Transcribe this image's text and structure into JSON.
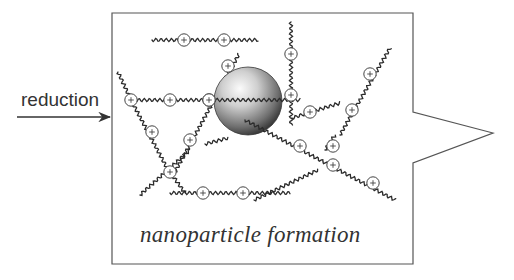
{
  "diagram": {
    "input_label": "reduction",
    "caption": "nanoparticle formation",
    "arrow": {
      "from": [
        17,
        117
      ],
      "to": [
        110,
        117
      ],
      "color": "#333333"
    },
    "box": {
      "outline": [
        [
          112,
          13
        ],
        [
          413,
          13
        ],
        [
          413,
          112
        ],
        [
          493,
          133
        ],
        [
          413,
          163
        ],
        [
          413,
          264
        ],
        [
          112,
          264
        ]
      ],
      "stroke": "#555555"
    },
    "nanoparticle": {
      "cx": 248,
      "cy": 101,
      "r": 34,
      "highlight": "#f5f5f5",
      "shade": "#2a2a2a"
    },
    "bead_symbol": "+",
    "chains": [
      {
        "id": "top",
        "path": [
          [
            152,
            40
          ],
          [
            258,
            40
          ]
        ],
        "beads": [
          [
            184,
            40
          ],
          [
            224,
            40
          ]
        ]
      },
      {
        "id": "left-horizontal",
        "path": [
          [
            130,
            100
          ],
          [
            300,
            100
          ]
        ],
        "beads": [
          [
            131,
            100
          ],
          [
            170,
            100
          ],
          [
            209,
            100
          ]
        ]
      },
      {
        "id": "left-upper-diag",
        "path": [
          [
            118,
            72
          ],
          [
            131,
            100
          ]
        ],
        "beads": []
      },
      {
        "id": "left-lower-diag",
        "path": [
          [
            131,
            100
          ],
          [
            168,
            170
          ]
        ],
        "beads": [
          [
            152,
            132
          ]
        ]
      },
      {
        "id": "rising-diag",
        "path": [
          [
            175,
            172
          ],
          [
            239,
            54
          ]
        ],
        "beads": [
          [
            190,
            140
          ],
          [
            228,
            66
          ],
          [
            209,
            100
          ]
        ]
      },
      {
        "id": "x-cross-lower",
        "path": [
          [
            140,
            195
          ],
          [
            190,
            150
          ]
        ],
        "beads": [
          [
            170,
            172
          ]
        ]
      },
      {
        "id": "x-cross-right",
        "path": [
          [
            170,
            172
          ],
          [
            185,
            193
          ]
        ],
        "beads": []
      },
      {
        "id": "bottom",
        "path": [
          [
            170,
            193
          ],
          [
            290,
            193
          ]
        ],
        "beads": [
          [
            203,
            193
          ],
          [
            243,
            193
          ]
        ]
      },
      {
        "id": "vertical-right",
        "path": [
          [
            291,
            22
          ],
          [
            291,
            125
          ]
        ],
        "beads": [
          [
            291,
            54
          ],
          [
            291,
            95
          ]
        ]
      },
      {
        "id": "short-right",
        "path": [
          [
            292,
            118
          ],
          [
            340,
            103
          ]
        ],
        "beads": [
          [
            310,
            112
          ]
        ]
      },
      {
        "id": "sphere-small-left",
        "path": [
          [
            205,
            144
          ],
          [
            228,
            138
          ]
        ],
        "beads": []
      },
      {
        "id": "diag-through-sphere",
        "path": [
          [
            245,
            120
          ],
          [
            395,
            200
          ]
        ],
        "beads": [
          [
            300,
            146
          ],
          [
            333,
            165
          ],
          [
            373,
            183
          ]
        ]
      },
      {
        "id": "right-diag",
        "path": [
          [
            340,
            135
          ],
          [
            390,
            48
          ]
        ],
        "beads": [
          [
            370,
            74
          ],
          [
            352,
            110
          ]
        ]
      },
      {
        "id": "lower-left-chain",
        "path": [
          [
            254,
            200
          ],
          [
            318,
            170
          ]
        ],
        "beads": []
      },
      {
        "id": "lower-right-short",
        "path": [
          [
            325,
            150
          ],
          [
            335,
            135
          ]
        ],
        "beads": [
          [
            333,
            146
          ]
        ]
      }
    ]
  }
}
